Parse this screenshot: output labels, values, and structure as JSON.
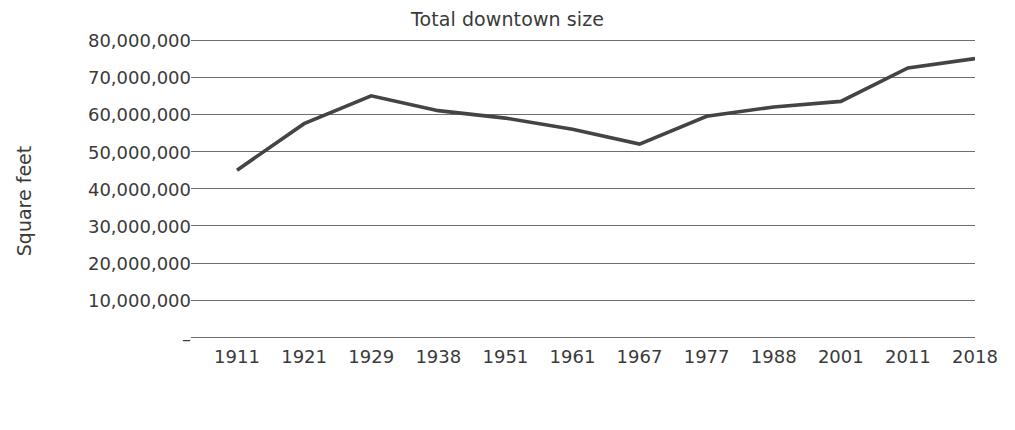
{
  "chart_data": {
    "type": "line",
    "title": "Total downtown size",
    "xlabel": "Year",
    "ylabel": "Square feet",
    "categories": [
      "1911",
      "1921",
      "1929",
      "1938",
      "1951",
      "1961",
      "1967",
      "1977",
      "1988",
      "2001",
      "2011",
      "2018"
    ],
    "values": [
      45000000,
      57500000,
      65000000,
      61000000,
      59000000,
      56000000,
      52000000,
      59500000,
      62000000,
      63500000,
      72500000,
      75000000
    ],
    "series": [
      {
        "name": "Total downtown size",
        "values": [
          45000000,
          57500000,
          65000000,
          61000000,
          59000000,
          56000000,
          52000000,
          59500000,
          62000000,
          63500000,
          72500000,
          75000000
        ]
      }
    ],
    "ylim": [
      0,
      80000000
    ],
    "ytick_values": [
      80000000,
      70000000,
      60000000,
      50000000,
      40000000,
      30000000,
      20000000,
      10000000,
      0
    ],
    "ytick_labels": [
      "80,000,000",
      "70,000,000",
      "60,000,000",
      "50,000,000",
      "40,000,000",
      "30,000,000",
      "20,000,000",
      "10,000,000",
      "–"
    ],
    "grid": "horizontal",
    "legend": "none",
    "line_color": "#444444",
    "grid_color": "#6e6e6e",
    "background_color": "#ffffff"
  }
}
